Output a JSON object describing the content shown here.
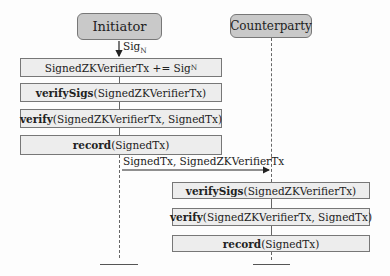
{
  "actors": {
    "initiator": "Initiator",
    "counterparty": "Counterparty"
  },
  "messages": {
    "sig": {
      "base": "Sig",
      "sub": "N"
    },
    "transfer": "SignedTx, SignedZKVerifierTx"
  },
  "initiator_steps": [
    {
      "fn": "",
      "args": "SignedZKVerifierTx += Sig",
      "sub": "N"
    },
    {
      "fn": "verifySigs",
      "args": "(SignedZKVerifierTx)"
    },
    {
      "fn": "verify",
      "args": "(SignedZKVerifierTx, SignedTx)"
    },
    {
      "fn": "record",
      "args": "(SignedTx)"
    }
  ],
  "counterparty_steps": [
    {
      "fn": "verifySigs",
      "args": "(SignedZKVerifierTx)"
    },
    {
      "fn": "verify",
      "args": "(SignedZKVerifierTx, SignedTx)"
    },
    {
      "fn": "record",
      "args": "(SignedTx)"
    }
  ]
}
